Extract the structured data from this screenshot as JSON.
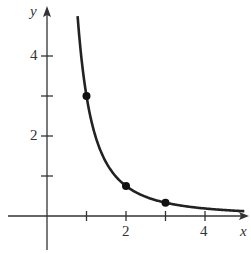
{
  "chart_data": {
    "type": "line",
    "title": "",
    "function": "y = 3/x^2",
    "xlabel": "x",
    "ylabel": "y",
    "x_ticks": [
      1,
      2,
      3,
      4
    ],
    "x_tick_labels": {
      "2": "2",
      "4": "4"
    },
    "y_ticks": [
      1,
      2,
      3,
      4
    ],
    "y_tick_labels": {
      "2": "2",
      "4": "4"
    },
    "xlim": [
      -1.1,
      5
    ],
    "ylim": [
      -0.9,
      5.1
    ],
    "grid": false,
    "series": [
      {
        "name": "curve",
        "x": [
          0.775,
          1,
          1.5,
          2,
          2.5,
          3,
          3.5,
          4,
          4.5,
          5
        ],
        "y": [
          5,
          3,
          1.33,
          0.75,
          0.48,
          0.33,
          0.24,
          0.19,
          0.15,
          0.12
        ]
      }
    ],
    "marked_points": [
      {
        "x": 1,
        "y": 3
      },
      {
        "x": 2,
        "y": 0.75
      },
      {
        "x": 3,
        "y": 0.333
      }
    ]
  },
  "labels": {
    "x_axis": "x",
    "y_axis": "y",
    "x2": "2",
    "x4": "4",
    "y2": "2",
    "y4": "4"
  },
  "colors": {
    "axis": "#333333",
    "curve": "#222222"
  }
}
